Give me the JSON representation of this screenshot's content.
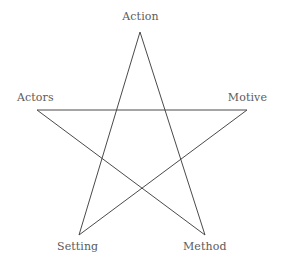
{
  "diagram": {
    "type": "pentagram",
    "title": "",
    "background_color": "#ffffff",
    "stroke_color": "#4a4a4a",
    "stroke_width": 1,
    "label_color": "#5b5b5b",
    "vertices": [
      {
        "id": "action",
        "label": "Action",
        "x": 140,
        "y": 32,
        "position": "top"
      },
      {
        "id": "actors",
        "label": "Actors",
        "x": 37,
        "y": 110,
        "position": "left"
      },
      {
        "id": "motive",
        "label": "Motive",
        "x": 247,
        "y": 110,
        "position": "right"
      },
      {
        "id": "setting",
        "label": "Setting",
        "x": 79,
        "y": 235,
        "position": "bottom-left"
      },
      {
        "id": "method",
        "label": "Method",
        "x": 205,
        "y": 235,
        "position": "bottom-right"
      }
    ],
    "edges": [
      {
        "from": "action",
        "to": "method"
      },
      {
        "from": "method",
        "to": "actors"
      },
      {
        "from": "actors",
        "to": "motive"
      },
      {
        "from": "motive",
        "to": "setting"
      },
      {
        "from": "setting",
        "to": "action"
      }
    ],
    "edge_path": "M 140,32 L 205,235 L 37,110 L 247,110 L 79,235 Z"
  }
}
